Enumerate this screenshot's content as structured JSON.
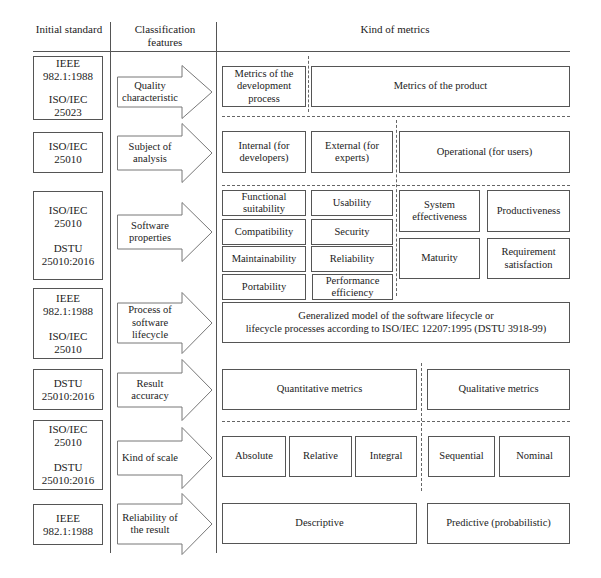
{
  "headers": {
    "col1": "Initial standard",
    "col2": "Classification features",
    "col3": "Kind of metrics"
  },
  "rows": [
    {
      "standards": [
        "IEEE 982.1:1988",
        "ISO/IEC 25023"
      ],
      "feature": "Quality characteristic",
      "metrics": [
        "Metrics of the development process",
        "Metrics of the product"
      ]
    },
    {
      "standards": [
        "ISO/IEC 25010"
      ],
      "feature": "Subject of analysis",
      "metrics": [
        "Internal (for developers)",
        "External (for experts)",
        "Operational (for users)"
      ]
    },
    {
      "standards": [
        "ISO/IEC 25010",
        "DSTU 25010:2016"
      ],
      "feature": "Software properties",
      "metrics": [
        "Functional suitability",
        "Compatibility",
        "Maintainability",
        "Portability",
        "Usability",
        "Security",
        "Reliability",
        "Performance efficiency",
        "System effectiveness",
        "Productiveness",
        "Maturity",
        "Requirement satisfaction"
      ]
    },
    {
      "standards": [
        "IEEE 982.1:1988",
        "ISO/IEC 25010"
      ],
      "feature": "Process of software lifecycle",
      "metrics": [
        "Generalized model of the software lifecycle or lifecycle processes according to ISO/IEC 12207:1995 (DSTU 3918-99)"
      ]
    },
    {
      "standards": [
        "DSTU 25010:2016"
      ],
      "feature": "Result accuracy",
      "metrics": [
        "Quantitative metrics",
        "Qualitative metrics"
      ]
    },
    {
      "standards": [
        "ISO/IEC 25010",
        "DSTU 25010:2016"
      ],
      "feature": "Kind of scale",
      "metrics": [
        "Absolute",
        "Relative",
        "Integral",
        "Sequential",
        "Nominal"
      ]
    },
    {
      "standards": [
        "IEEE 982.1:1988"
      ],
      "feature": "Reliability of the result",
      "metrics": [
        "Descriptive",
        "Predictive (probabilistic)"
      ]
    }
  ],
  "text": {
    "r0s0a": "IEEE",
    "r0s0b": "982.1:1988",
    "r0s1a": "ISO/IEC",
    "r0s1b": "25023",
    "r1s0a": "ISO/IEC",
    "r1s0b": "25010",
    "r2s0a": "ISO/IEC",
    "r2s0b": "25010",
    "r2s1a": "DSTU",
    "r2s1b": "25010:2016",
    "r3s0a": "IEEE",
    "r3s0b": "982.1:1988",
    "r3s1a": "ISO/IEC",
    "r3s1b": "25010",
    "r4s0a": "DSTU",
    "r4s0b": "25010:2016",
    "r5s0a": "ISO/IEC",
    "r5s0b": "25010",
    "r5s1a": "DSTU",
    "r5s1b": "25010:2016",
    "r6s0a": "IEEE",
    "r6s0b": "982.1:1988",
    "lifecycle_line1": "Generalized model of the software lifecycle or",
    "lifecycle_line2": "lifecycle processes according to ISO/IEC 12207:1995 (DSTU 3918-99)"
  }
}
